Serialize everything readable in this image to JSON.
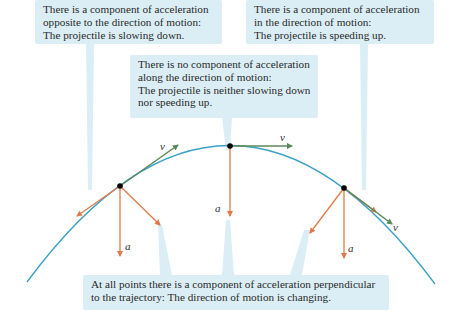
{
  "callouts": {
    "slowing": {
      "lines": [
        "There is a component of acceleration",
        "opposite to the direction of motion:",
        "The projectile is slowing down."
      ]
    },
    "speeding": {
      "lines": [
        "There is a component of acceleration",
        "in the direction of motion:",
        "The projectile is speeding up."
      ]
    },
    "apex": {
      "lines": [
        "There is no component of acceleration",
        "along the direction of motion:",
        "The projectile is neither slowing down",
        "nor speeding up."
      ]
    },
    "perpendicular": {
      "lines": [
        "At all points there is a component of acceleration perpendicular",
        "to the trajectory: The direction of motion is changing."
      ]
    }
  },
  "labels": {
    "velocity": "v⃗",
    "acceleration": "a⃗"
  },
  "colors": {
    "trajectory": "#3aa0c8",
    "velocity": "#5a8a5a",
    "acceleration": "#e07a4a",
    "callout_bg": "#dbeef6",
    "point": "#000000"
  }
}
